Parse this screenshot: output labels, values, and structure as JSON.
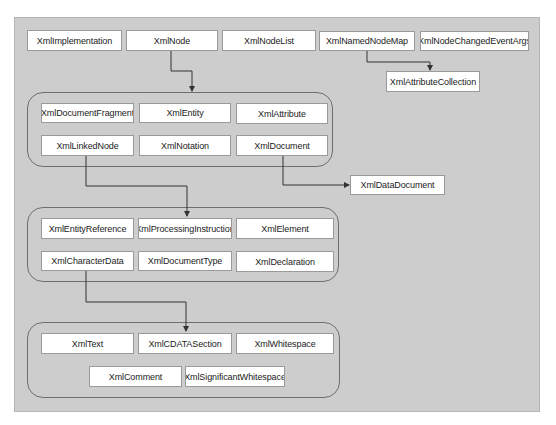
{
  "diagram": {
    "title": "",
    "colors": {
      "panel": "#cdcdcd",
      "node_fill": "#ffffff",
      "node_border": "#9a9a9a",
      "group_border": "#6f6f6f",
      "edge": "#333333"
    },
    "top_row": [
      {
        "id": "XmlImplementation",
        "label": "XmlImplementation"
      },
      {
        "id": "XmlNode",
        "label": "XmlNode"
      },
      {
        "id": "XmlNodeList",
        "label": "XmlNodeList"
      },
      {
        "id": "XmlNamedNodeMap",
        "label": "XmlNamedNodeMap"
      },
      {
        "id": "XmlNodeChangedEventArgs",
        "label": "XmlNodeChangedEventArgs"
      }
    ],
    "attribute_collection": {
      "id": "XmlAttributeCollection",
      "label": "XmlAttributeCollection"
    },
    "data_document": {
      "id": "XmlDataDocument",
      "label": "XmlDataDocument"
    },
    "group1": [
      {
        "id": "XmlDocumentFragment",
        "label": "XmlDocumentFragment"
      },
      {
        "id": "XmlEntity",
        "label": "XmlEntity"
      },
      {
        "id": "XmlAttribute",
        "label": "XmlAttribute"
      },
      {
        "id": "XmlLinkedNode",
        "label": "XmlLinkedNode"
      },
      {
        "id": "XmlNotation",
        "label": "XmlNotation"
      },
      {
        "id": "XmlDocument",
        "label": "XmlDocument"
      }
    ],
    "group2": [
      {
        "id": "XmlEntityReference",
        "label": "XmlEntityReference"
      },
      {
        "id": "XmlProcessingInstruction",
        "label": "XmlProcessingInstruction"
      },
      {
        "id": "XmlElement",
        "label": "XmlElement"
      },
      {
        "id": "XmlCharacterData",
        "label": "XmlCharacterData"
      },
      {
        "id": "XmlDocumentType",
        "label": "XmlDocumentType"
      },
      {
        "id": "XmlDeclaration",
        "label": "XmlDeclaration"
      }
    ],
    "group3": [
      {
        "id": "XmlText",
        "label": "XmlText"
      },
      {
        "id": "XmlCDATASection",
        "label": "XmlCDATASection"
      },
      {
        "id": "XmlWhitespace",
        "label": "XmlWhitespace"
      },
      {
        "id": "XmlComment",
        "label": "XmlComment"
      },
      {
        "id": "XmlSignificantWhitespace",
        "label": "XmlSignificantWhitespace"
      }
    ],
    "edges": [
      {
        "from": "XmlNode",
        "to": "group1"
      },
      {
        "from": "XmlNamedNodeMap",
        "to": "XmlAttributeCollection"
      },
      {
        "from": "XmlLinkedNode",
        "to": "group2"
      },
      {
        "from": "XmlDocument",
        "to": "XmlDataDocument"
      },
      {
        "from": "XmlCharacterData",
        "to": "group3"
      }
    ]
  }
}
